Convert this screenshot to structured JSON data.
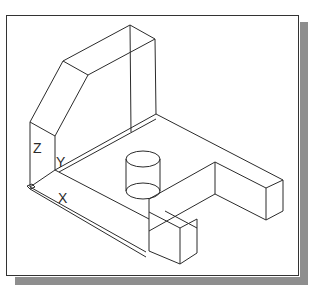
{
  "figure": {
    "ucs_icon": {
      "axis_z_label": "Z",
      "axis_y_label": "Y",
      "axis_x_label": "X"
    },
    "colors": {
      "line": "#2b2b2b",
      "frame": "#333333",
      "shadow": "#8e8e8e",
      "background": "#ffffff"
    }
  }
}
